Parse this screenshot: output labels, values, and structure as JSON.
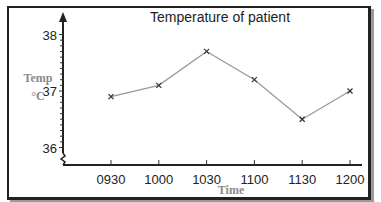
{
  "chart_data": {
    "type": "line",
    "title": "Temperature of patient",
    "xlabel": "Time",
    "ylabel": "Temp °C",
    "ylabel_lines": [
      "Temp",
      "°C"
    ],
    "categories": [
      "0930",
      "1000",
      "1030",
      "1100",
      "1130",
      "1200"
    ],
    "values": [
      36.9,
      37.1,
      37.7,
      37.2,
      36.5,
      37.0
    ],
    "yticks": [
      "36",
      "37",
      "38"
    ],
    "ylim": [
      35.8,
      38.2
    ],
    "y_axis_break": true,
    "marker": "x",
    "grid": false,
    "line_color": "#999999",
    "marker_color": "#333333"
  }
}
